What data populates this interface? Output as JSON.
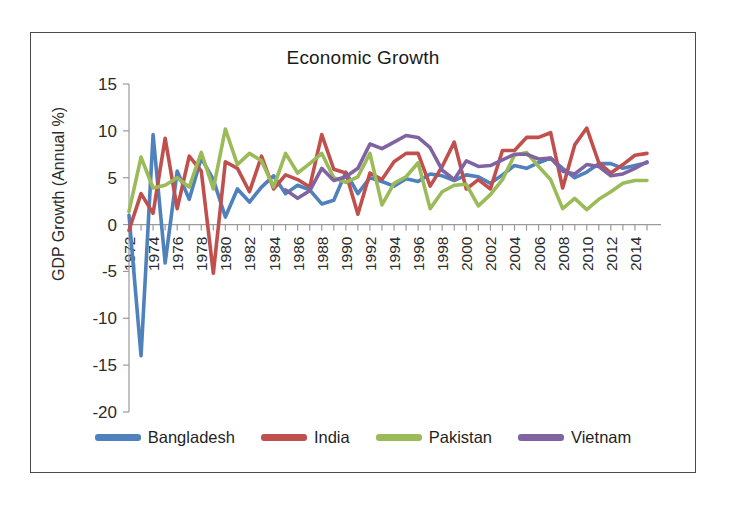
{
  "chart_data": {
    "type": "line",
    "title": "Economic Growth",
    "xlabel": "",
    "ylabel": "GDP Growth (Annual %)",
    "ylim": [
      -20,
      15
    ],
    "ytick_step": 5,
    "yticks": [
      15,
      10,
      5,
      0,
      -5,
      -10,
      -15,
      -20
    ],
    "xlim": [
      1972,
      2015
    ],
    "xtick_step": 2,
    "xticks": [
      1972,
      1974,
      1976,
      1978,
      1980,
      1982,
      1984,
      1986,
      1988,
      1990,
      1992,
      1994,
      1996,
      1998,
      2000,
      2002,
      2004,
      2006,
      2008,
      2010,
      2012,
      2014
    ],
    "x": [
      1972,
      1973,
      1974,
      1975,
      1976,
      1977,
      1978,
      1979,
      1980,
      1981,
      1982,
      1983,
      1984,
      1985,
      1986,
      1987,
      1988,
      1989,
      1990,
      1991,
      1992,
      1993,
      1994,
      1995,
      1996,
      1997,
      1998,
      1999,
      2000,
      2001,
      2002,
      2003,
      2004,
      2005,
      2006,
      2007,
      2008,
      2009,
      2010,
      2011,
      2012,
      2013,
      2014,
      2015
    ],
    "grid": false,
    "legend_position": "bottom",
    "series": [
      {
        "name": "Bangladesh",
        "color": "#4F81BD",
        "values": [
          1.0,
          -14.0,
          9.6,
          -4.1,
          5.7,
          2.7,
          7.1,
          4.8,
          0.8,
          3.8,
          2.4,
          4.0,
          5.2,
          3.3,
          4.2,
          3.7,
          2.2,
          2.6,
          5.6,
          3.3,
          5.0,
          4.6,
          4.1,
          4.9,
          4.6,
          5.4,
          5.2,
          4.7,
          5.3,
          5.1,
          4.4,
          5.3,
          6.3,
          6.0,
          6.6,
          7.1,
          6.0,
          5.0,
          5.6,
          6.5,
          6.5,
          6.0,
          6.3,
          6.6
        ],
        "width": 3.6
      },
      {
        "name": "India",
        "color": "#C0504D",
        "values": [
          -0.6,
          3.3,
          1.2,
          9.2,
          1.7,
          7.3,
          5.7,
          -5.2,
          6.7,
          6.0,
          3.5,
          7.3,
          3.8,
          5.3,
          4.8,
          4.0,
          9.6,
          5.9,
          5.5,
          1.1,
          5.5,
          4.8,
          6.7,
          7.6,
          7.6,
          4.1,
          6.2,
          8.8,
          3.8,
          4.8,
          3.8,
          7.9,
          7.9,
          9.3,
          9.3,
          9.8,
          3.9,
          8.5,
          10.3,
          6.6,
          5.5,
          6.4,
          7.4,
          7.6
        ],
        "width": 3.6
      },
      {
        "name": "Pakistan",
        "color": "#9BBB59",
        "values": [
          1.4,
          7.2,
          3.9,
          4.2,
          5.0,
          4.0,
          7.7,
          3.8,
          10.2,
          6.4,
          7.6,
          6.8,
          4.0,
          7.6,
          5.5,
          6.5,
          7.6,
          5.0,
          4.5,
          5.1,
          7.6,
          2.1,
          4.4,
          5.1,
          6.6,
          1.7,
          3.5,
          4.2,
          4.3,
          2.0,
          3.2,
          4.8,
          7.4,
          7.7,
          6.2,
          4.8,
          1.7,
          2.8,
          1.6,
          2.7,
          3.5,
          4.4,
          4.7,
          4.7
        ],
        "width": 3.6
      },
      {
        "name": "Vietnam",
        "color": "#8064A2",
        "values": [
          null,
          null,
          null,
          null,
          null,
          null,
          null,
          null,
          null,
          null,
          null,
          null,
          null,
          3.7,
          2.8,
          3.6,
          6.0,
          4.7,
          5.1,
          6.0,
          8.6,
          8.1,
          8.8,
          9.5,
          9.3,
          8.2,
          5.8,
          4.8,
          6.8,
          6.2,
          6.3,
          6.9,
          7.5,
          7.5,
          7.0,
          7.1,
          5.7,
          5.4,
          6.4,
          6.2,
          5.2,
          5.4,
          6.0,
          6.7
        ],
        "width": 3.6
      }
    ]
  },
  "legend": {
    "items": [
      {
        "label": "Bangladesh",
        "color": "#4F81BD"
      },
      {
        "label": "India",
        "color": "#C0504D"
      },
      {
        "label": "Pakistan",
        "color": "#9BBB59"
      },
      {
        "label": "Vietnam",
        "color": "#8064A2"
      }
    ]
  },
  "axis": {
    "color": "#9a9a9a"
  }
}
